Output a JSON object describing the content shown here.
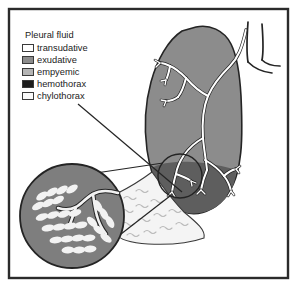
{
  "figure": {
    "frame_color": "#2b2b2b",
    "background": "#ffffff"
  },
  "legend": {
    "title": "Pleural fluid",
    "items": [
      {
        "label": "transudative",
        "color": "#ffffff",
        "swatch_name": "swatch-transudative"
      },
      {
        "label": "exudative",
        "color": "#8c8c8c",
        "swatch_name": "swatch-exudative"
      },
      {
        "label": "empyemic",
        "color": "#b4b4b4",
        "swatch_name": "swatch-empyemic"
      },
      {
        "label": "hemothorax",
        "color": "#1c1c1c",
        "swatch_name": "swatch-hemothorax"
      },
      {
        "label": "chylothorax",
        "color": "#fbfbfb",
        "swatch_name": "swatch-chylothorax"
      }
    ]
  },
  "illustration": {
    "lung_color": "#8c8c8c",
    "lung_base_color": "#5e5e5e",
    "pleural_fluid_color": "#f4f4f4",
    "bronchial_tree_color": "#ffffff",
    "inset_circle_color": "#7e7e7e",
    "alveoli_color": "#f2f2f2",
    "outline_color": "#242424",
    "parts": [
      {
        "name": "lung-silhouette",
        "label": "lung"
      },
      {
        "name": "bronchial-tree",
        "label": "bronchial tree"
      },
      {
        "name": "trachea",
        "label": "trachea"
      },
      {
        "name": "main-bronchus",
        "label": "main bronchus"
      },
      {
        "name": "pleural-fluid-area",
        "label": "pleural fluid"
      },
      {
        "name": "lung-base-effusion",
        "label": "lung base effusion"
      },
      {
        "name": "magnifier-inset",
        "label": "magnified alveoli"
      },
      {
        "name": "source-circle",
        "label": "magnification source"
      },
      {
        "name": "leader-line",
        "label": "pointer line"
      }
    ]
  }
}
